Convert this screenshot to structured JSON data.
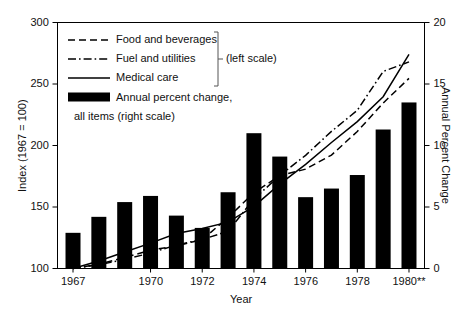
{
  "chart_data": {
    "type": "bar",
    "title": "",
    "xlabel": "Year",
    "ylabel": "Index (1967 = 100)",
    "y2label": "Annual Percent Change",
    "grid": false,
    "legend_position": "top-left",
    "xlim": [
      1966.4,
      1980.6
    ],
    "ylim": [
      100,
      300
    ],
    "y2lim": [
      0,
      20
    ],
    "yticks": [
      100,
      150,
      200,
      250,
      300
    ],
    "y2ticks": [
      0,
      5,
      10,
      15,
      20
    ],
    "xtick_values": [
      1967,
      1970,
      1972,
      1974,
      1976,
      1978,
      1980
    ],
    "xtick_labels": [
      "1967",
      "1970",
      "1972",
      "1974",
      "1976",
      "1978",
      "1980**"
    ],
    "x": [
      1967,
      1968,
      1969,
      1970,
      1971,
      1972,
      1973,
      1974,
      1975,
      1976,
      1977,
      1978,
      1979,
      1980
    ],
    "bars": {
      "name": "Annual percent change, all items (right scale)",
      "axis": "right",
      "color": "#000000",
      "values": [
        2.9,
        4.2,
        5.4,
        5.9,
        4.3,
        3.3,
        6.2,
        11.0,
        9.1,
        5.8,
        6.5,
        7.6,
        11.3,
        13.5
      ]
    },
    "series": [
      {
        "name": "Food and beverages",
        "axis": "left",
        "style": "dashed",
        "color": "#000000",
        "values": [
          100,
          103.6,
          108.9,
          114.9,
          118.4,
          123.5,
          141.4,
          161.7,
          175.4,
          180.8,
          192.2,
          211.4,
          234.5,
          254.6
        ]
      },
      {
        "name": "Fuel and utilities",
        "axis": "left",
        "style": "dashdot",
        "color": "#000000",
        "values": [
          100,
          103.1,
          107.3,
          112.6,
          119.1,
          123.6,
          130.3,
          156.5,
          175.6,
          192.0,
          211.5,
          228.6,
          260.2,
          268.0
        ]
      },
      {
        "name": "Medical care",
        "axis": "left",
        "style": "solid",
        "color": "#000000",
        "values": [
          100,
          106.1,
          113.4,
          120.6,
          128.4,
          132.5,
          137.7,
          150.5,
          168.6,
          184.7,
          202.4,
          219.4,
          239.7,
          274.0
        ]
      }
    ],
    "legend": [
      {
        "label": "Food and beverages",
        "style": "dashed"
      },
      {
        "label": "Fuel and utilities",
        "style": "dashdot"
      },
      {
        "label": "Medical care",
        "style": "solid"
      },
      {
        "label": "Annual percent change,",
        "style": "swatch"
      },
      {
        "label": "all items (right scale)",
        "style": "continuation"
      }
    ],
    "legend_bracket_label": "(left scale)"
  }
}
